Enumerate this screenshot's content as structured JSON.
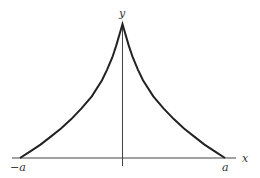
{
  "chart_data": {
    "type": "line",
    "title": "",
    "xlabel": "x",
    "ylabel": "y",
    "tick_labels": {
      "left": "−a",
      "right": "a"
    },
    "xlim": [
      -1.1,
      1.1
    ],
    "ylim": [
      0,
      1
    ],
    "grid": false,
    "legend": null,
    "series": [
      {
        "name": "curve",
        "x": [
          -1.0,
          -0.9,
          -0.8,
          -0.7,
          -0.6,
          -0.5,
          -0.4,
          -0.3,
          -0.2,
          -0.15,
          -0.1,
          -0.06,
          -0.03,
          0.0,
          0.03,
          0.06,
          0.1,
          0.15,
          0.2,
          0.3,
          0.4,
          0.5,
          0.6,
          0.7,
          0.8,
          0.9,
          1.0
        ],
        "y": [
          0.0,
          0.05,
          0.1,
          0.16,
          0.22,
          0.29,
          0.37,
          0.46,
          0.58,
          0.66,
          0.75,
          0.84,
          0.92,
          1.0,
          0.92,
          0.84,
          0.75,
          0.66,
          0.58,
          0.46,
          0.37,
          0.29,
          0.22,
          0.16,
          0.1,
          0.05,
          0.0
        ]
      }
    ]
  },
  "colors": {
    "axis": "#444444",
    "curve": "#222222",
    "label": "#333333"
  }
}
